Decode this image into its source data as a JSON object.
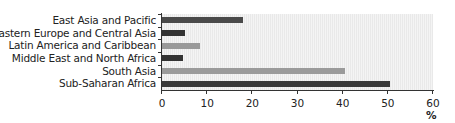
{
  "chart_data": {
    "type": "bar",
    "orientation": "horizontal",
    "title": "",
    "xlabel": "%",
    "ylabel": "",
    "xlim": [
      0,
      60
    ],
    "x_ticks": [
      "0",
      "10",
      "20",
      "30",
      "40",
      "50",
      "60"
    ],
    "categories": [
      "East Asia and Pacific",
      "Eastern Europe and Central Asia",
      "Latin America and Caribbean",
      "Middle East and North Africa",
      "South Asia",
      "Sub-Saharan Africa"
    ],
    "values": [
      18,
      5,
      8.5,
      4.7,
      40.5,
      50.5
    ],
    "bar_colors": [
      "#4a4a4a",
      "#333333",
      "#999999",
      "#333333",
      "#9a9a9a",
      "#3a3a3a"
    ],
    "grid": false,
    "legend": null
  }
}
